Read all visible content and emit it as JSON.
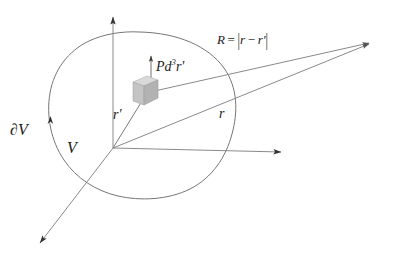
{
  "figure": {
    "type": "vector-field-geometry-diagram",
    "colors": {
      "line": "#666666",
      "axis": "#7a7a7a",
      "text": "#1a1a1a",
      "cube_front": "#bdbdbd",
      "cube_top": "#d8d8d8",
      "cube_side": "#a8a8a8",
      "background": "#ffffff"
    }
  },
  "labels": {
    "boundary_surface": "∂V",
    "volume": "V",
    "source_position": "r",
    "source_position_prime": "'",
    "field_position": "r",
    "separation_prefix": "R",
    "separation_equals": "=",
    "separation_bar": "|",
    "separation_r": "r",
    "separation_minus": "−",
    "separation_rprime": "r",
    "separation_prime_tick": "'",
    "dipole_P": "P",
    "dipole_d": "d",
    "dipole_exp": "3",
    "dipole_r": "r",
    "dipole_prime": "'"
  },
  "geometry": {
    "origin": [
      113,
      148
    ],
    "axis_vertical_tip": [
      113,
      14
    ],
    "axis_horizontal_tip": [
      285,
      152
    ],
    "axis_diagonal_tip": [
      36,
      247
    ],
    "cube_anchor": [
      150,
      95
    ],
    "field_point": [
      373,
      42
    ],
    "blob_extent": {
      "left": 48,
      "right": 236,
      "top": 32,
      "bottom": 199
    }
  }
}
